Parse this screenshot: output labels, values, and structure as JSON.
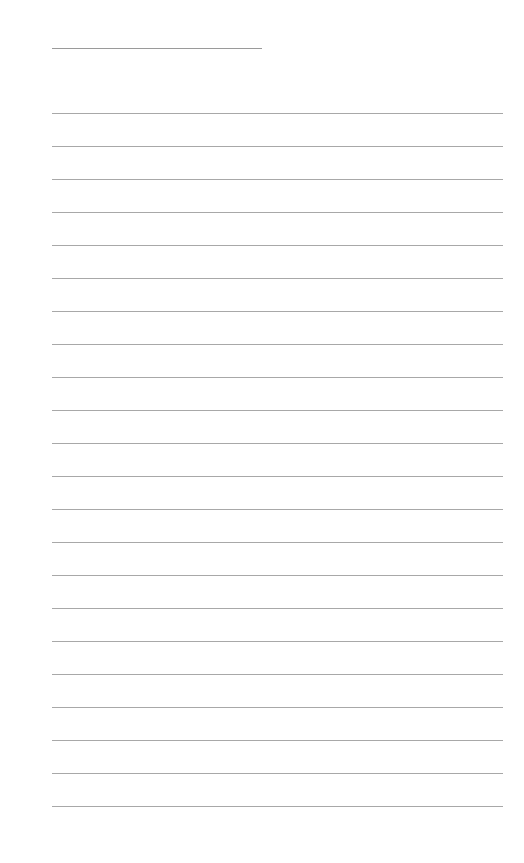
{
  "page": {
    "type": "lined-sheet",
    "background": "#ffffff",
    "line_color": "#a8a8a8",
    "title_line": {
      "present": true,
      "text": ""
    },
    "ruled_lines": {
      "count": 22,
      "start_y": 113,
      "spacing": 33
    },
    "lines": [
      "",
      "",
      "",
      "",
      "",
      "",
      "",
      "",
      "",
      "",
      "",
      "",
      "",
      "",
      "",
      "",
      "",
      "",
      "",
      "",
      "",
      ""
    ]
  }
}
